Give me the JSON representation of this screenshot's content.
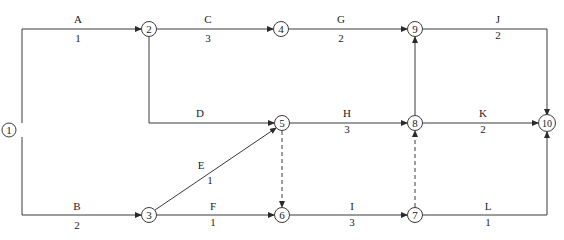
{
  "diagram": {
    "type": "activity-on-arrow network",
    "nodes": [
      {
        "id": "1",
        "label": "1",
        "x": 9,
        "y": 130
      },
      {
        "id": "2",
        "label": "2",
        "x": 149,
        "y": 29
      },
      {
        "id": "3",
        "label": "3",
        "x": 149,
        "y": 215
      },
      {
        "id": "4",
        "label": "4",
        "x": 281,
        "y": 29
      },
      {
        "id": "5",
        "label": "5",
        "x": 282,
        "y": 123
      },
      {
        "id": "6",
        "label": "6",
        "x": 282,
        "y": 215
      },
      {
        "id": "7",
        "label": "7",
        "x": 415,
        "y": 215
      },
      {
        "id": "8",
        "label": "8",
        "x": 415,
        "y": 123
      },
      {
        "id": "9",
        "label": "9",
        "x": 415,
        "y": 29
      },
      {
        "id": "10",
        "label": "10",
        "x": 547,
        "y": 123
      }
    ],
    "activities": [
      {
        "name": "A",
        "duration": "1",
        "from": "1",
        "to": "2"
      },
      {
        "name": "B",
        "duration": "2",
        "from": "1",
        "to": "3"
      },
      {
        "name": "C",
        "duration": "3",
        "from": "2",
        "to": "4"
      },
      {
        "name": "D",
        "duration": "",
        "from": "2",
        "to": "5"
      },
      {
        "name": "E",
        "duration": "1",
        "from": "3",
        "to": "5"
      },
      {
        "name": "F",
        "duration": "1",
        "from": "3",
        "to": "6"
      },
      {
        "name": "G",
        "duration": "2",
        "from": "4",
        "to": "9"
      },
      {
        "name": "H",
        "duration": "3",
        "from": "5",
        "to": "8"
      },
      {
        "name": "I",
        "duration": "3",
        "from": "6",
        "to": "7"
      },
      {
        "name": "J",
        "duration": "2",
        "from": "9",
        "to": "10"
      },
      {
        "name": "K",
        "duration": "2",
        "from": "8",
        "to": "10"
      },
      {
        "name": "L",
        "duration": "1",
        "from": "7",
        "to": "10"
      }
    ],
    "dummy_activities": [
      {
        "from": "5",
        "to": "6"
      },
      {
        "from": "7",
        "to": "8"
      },
      {
        "from": "8",
        "to": "9"
      }
    ]
  }
}
